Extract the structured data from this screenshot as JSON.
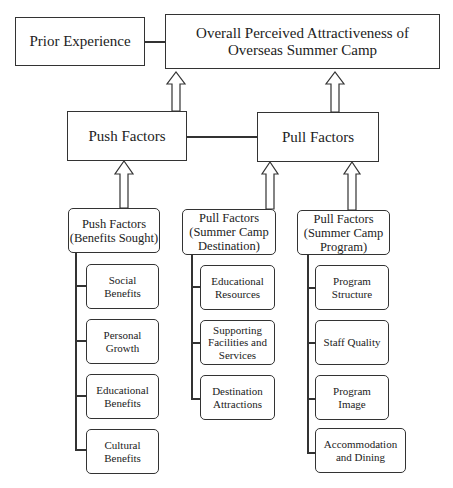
{
  "diagram": {
    "top": {
      "prior_experience": "Prior Experience",
      "overall": "Overall Perceived Attractiveness of Overseas Summer Camp"
    },
    "middle": {
      "push": "Push Factors",
      "pull": "Pull Factors"
    },
    "groups": [
      {
        "title": "Push Factors (Benefits Sought)",
        "items": [
          "Social Benefits",
          "Personal Growth",
          "Educational Benefits",
          "Cultural Benefits"
        ]
      },
      {
        "title": "Pull Factors (Summer Camp Destination)",
        "items": [
          "Educational Resources",
          "Supporting Facilities and Services",
          "Destination Attractions"
        ]
      },
      {
        "title": "Pull Factors (Summer Camp Program)",
        "items": [
          "Program Structure",
          "Staff Quality",
          "Program Image",
          "Accommodation and Dining"
        ]
      }
    ]
  },
  "colors": {
    "stroke": "#333333",
    "background": "#ffffff",
    "text": "#222222"
  }
}
